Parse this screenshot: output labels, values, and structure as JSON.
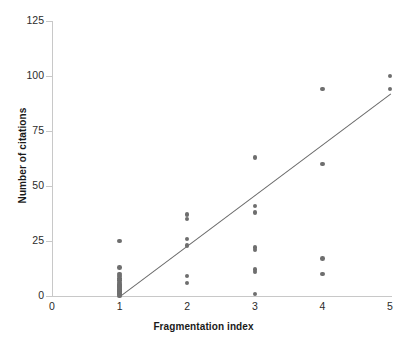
{
  "chart_data": {
    "type": "scatter",
    "title": "",
    "xlabel": "Fragmentation index",
    "ylabel": "Number of citations",
    "xlim": [
      0,
      5
    ],
    "ylim": [
      0,
      125
    ],
    "xticks": [
      0,
      1,
      2,
      3,
      4,
      5
    ],
    "yticks": [
      0,
      25,
      50,
      75,
      100,
      125
    ],
    "grid": false,
    "legend": null,
    "marker_color": "#6e6e6e",
    "trendline_color": "#6a6a6a",
    "points": [
      {
        "x": 1,
        "y": 0
      },
      {
        "x": 1,
        "y": 1
      },
      {
        "x": 1,
        "y": 1
      },
      {
        "x": 1,
        "y": 2
      },
      {
        "x": 1,
        "y": 2
      },
      {
        "x": 1,
        "y": 3
      },
      {
        "x": 1,
        "y": 3
      },
      {
        "x": 1,
        "y": 4
      },
      {
        "x": 1,
        "y": 4
      },
      {
        "x": 1,
        "y": 5
      },
      {
        "x": 1,
        "y": 5
      },
      {
        "x": 1,
        "y": 6
      },
      {
        "x": 1,
        "y": 7
      },
      {
        "x": 1,
        "y": 8
      },
      {
        "x": 1,
        "y": 9
      },
      {
        "x": 1,
        "y": 10
      },
      {
        "x": 1,
        "y": 13
      },
      {
        "x": 1,
        "y": 25
      },
      {
        "x": 2,
        "y": 6
      },
      {
        "x": 2,
        "y": 9
      },
      {
        "x": 2,
        "y": 23
      },
      {
        "x": 2,
        "y": 26
      },
      {
        "x": 2,
        "y": 35
      },
      {
        "x": 2,
        "y": 37
      },
      {
        "x": 3,
        "y": 1
      },
      {
        "x": 3,
        "y": 11
      },
      {
        "x": 3,
        "y": 12
      },
      {
        "x": 3,
        "y": 21
      },
      {
        "x": 3,
        "y": 22
      },
      {
        "x": 3,
        "y": 38
      },
      {
        "x": 3,
        "y": 41
      },
      {
        "x": 3,
        "y": 63
      },
      {
        "x": 4,
        "y": 10
      },
      {
        "x": 4,
        "y": 17
      },
      {
        "x": 4,
        "y": 60
      },
      {
        "x": 4,
        "y": 94
      },
      {
        "x": 5,
        "y": 94
      },
      {
        "x": 5,
        "y": 100
      }
    ],
    "trendline": {
      "x0": 1,
      "y0": 0,
      "x1": 5,
      "y1": 92
    }
  },
  "axis": {
    "y_tick_labels": [
      "125",
      "100",
      "75",
      "50",
      "25",
      "0"
    ],
    "x_tick_labels": [
      "0",
      "1",
      "2",
      "3",
      "4",
      "5"
    ],
    "x_title": "Fragmentation index",
    "y_title": "Number of citations"
  }
}
